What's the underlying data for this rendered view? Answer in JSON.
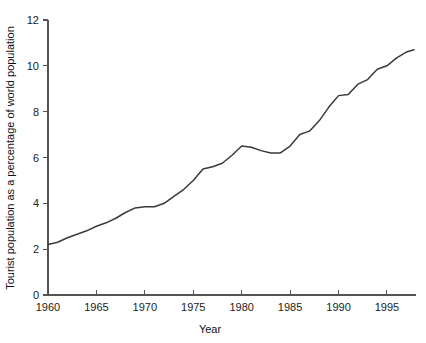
{
  "chart_data": {
    "type": "line",
    "title": "",
    "xlabel": "Year",
    "ylabel": "Tourist population as a percentage of world population",
    "xlim": [
      1960,
      1998
    ],
    "ylim": [
      0,
      12
    ],
    "grid": false,
    "legend": "none",
    "xticks": [
      1960,
      1965,
      1970,
      1975,
      1980,
      1985,
      1990,
      1995
    ],
    "xtick_labels": [
      "1960",
      "1965",
      "1970",
      "1975",
      "1980",
      "1985",
      "1990",
      "1995"
    ],
    "yticks": [
      0,
      2,
      4,
      6,
      8,
      10,
      12
    ],
    "ytick_labels": [
      "0",
      "2",
      "4",
      "6",
      "8",
      "10",
      "12"
    ],
    "series": [
      {
        "name": "Tourist population as a percentage of world population",
        "color": "#3a3a3a",
        "x": [
          1960,
          1961,
          1962,
          1963,
          1964,
          1965,
          1966,
          1967,
          1968,
          1969,
          1970,
          1971,
          1972,
          1973,
          1974,
          1975,
          1976,
          1977,
          1978,
          1979,
          1980,
          1981,
          1982,
          1983,
          1984,
          1985,
          1986,
          1987,
          1988,
          1989,
          1990,
          1991,
          1992,
          1993,
          1994,
          1995,
          1996,
          1997,
          1997.8
        ],
        "y": [
          2.2,
          2.3,
          2.5,
          2.65,
          2.8,
          3.0,
          3.15,
          3.35,
          3.6,
          3.8,
          3.85,
          3.85,
          4.0,
          4.3,
          4.6,
          5.0,
          5.5,
          5.6,
          5.75,
          6.1,
          6.5,
          6.45,
          6.3,
          6.2,
          6.2,
          6.5,
          7.0,
          7.15,
          7.6,
          8.2,
          8.7,
          8.75,
          9.2,
          9.4,
          9.85,
          10.0,
          10.35,
          10.6,
          10.7
        ]
      }
    ]
  },
  "axis_labels": {
    "x_title": "Year",
    "y_title": "Tourist population as a percentage of world population"
  }
}
